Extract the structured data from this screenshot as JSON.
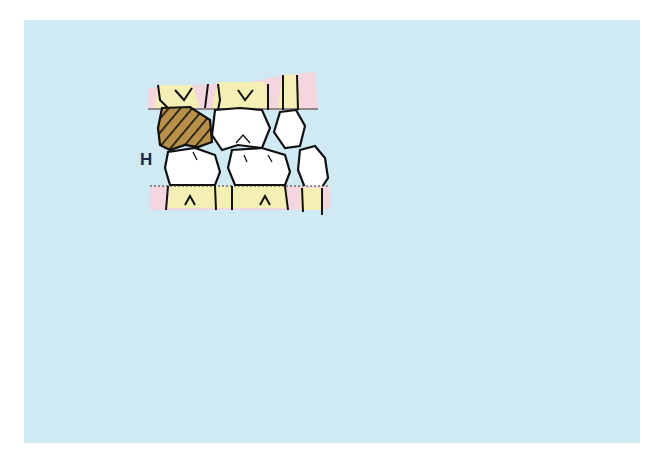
{
  "figure": {
    "background_color": "#cfeaf3",
    "colors": {
      "gingiva": "#f3d6de",
      "root_dentin": "#f4efb4",
      "enamel": "#ffffff",
      "hatched_tooth": "#b8904a",
      "outline": "#111111",
      "label": "#1c2a4a"
    },
    "top_panel": {
      "label": "H",
      "description": "Posterior teeth with hatched molar H; arrow indicating forward (mesial) drift",
      "arrow_direction": "right"
    },
    "bottom_panel": {
      "description": "Posterior teeth after drift; anterior incisors pushed forward",
      "arrow_direction": "right"
    }
  }
}
